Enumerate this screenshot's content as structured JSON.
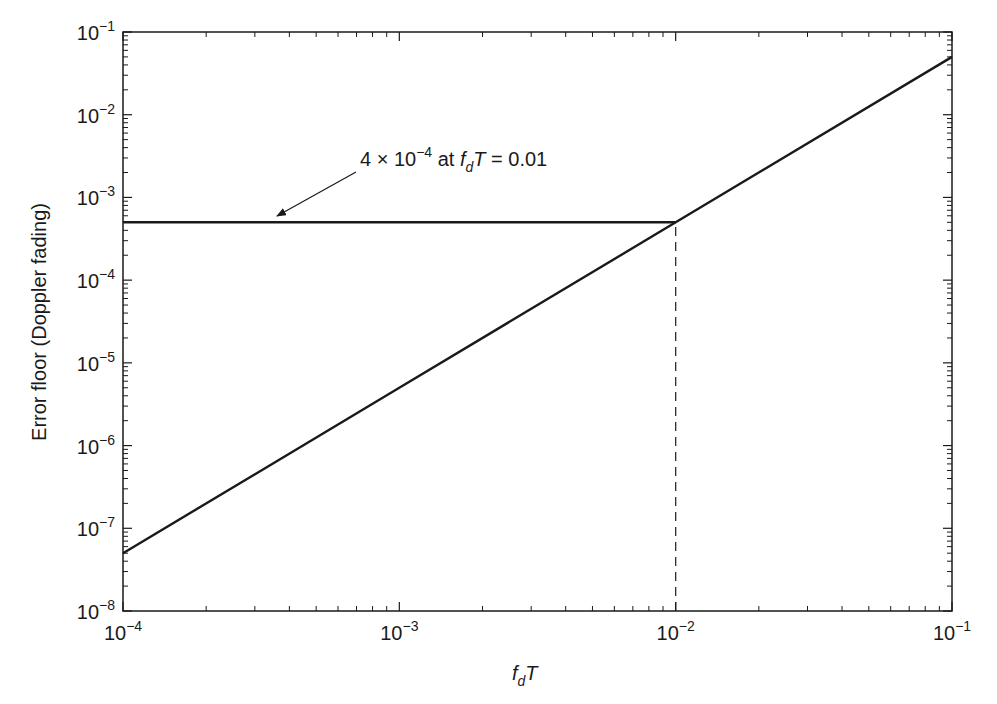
{
  "chart_data": {
    "type": "line",
    "title": "",
    "xlabel": "f_dT",
    "xlabel_parts": {
      "main": "f",
      "sub": "d",
      "tail": "T"
    },
    "ylabel": "Error floor (Doppler fading)",
    "xscale": "log",
    "yscale": "log",
    "xlim": [
      0.0001,
      0.1
    ],
    "ylim": [
      1e-08,
      0.1
    ],
    "grid": false,
    "x_ticks": [
      {
        "base": "10",
        "exp": "−4",
        "value": 0.0001
      },
      {
        "base": "10",
        "exp": "−3",
        "value": 0.001
      },
      {
        "base": "10",
        "exp": "−2",
        "value": 0.01
      },
      {
        "base": "10",
        "exp": "−1",
        "value": 0.1
      }
    ],
    "y_ticks": [
      {
        "base": "10",
        "exp": "−8",
        "value": 1e-08
      },
      {
        "base": "10",
        "exp": "−7",
        "value": 1e-07
      },
      {
        "base": "10",
        "exp": "−6",
        "value": 1e-06
      },
      {
        "base": "10",
        "exp": "−5",
        "value": 1e-05
      },
      {
        "base": "10",
        "exp": "−4",
        "value": 0.0001
      },
      {
        "base": "10",
        "exp": "−3",
        "value": 0.001
      },
      {
        "base": "10",
        "exp": "−2",
        "value": 0.01
      },
      {
        "base": "10",
        "exp": "−1",
        "value": 0.1
      }
    ],
    "series": [
      {
        "name": "Error floor vs f_dT",
        "style": "solid",
        "x": [
          0.0001,
          0.001,
          0.01,
          0.1
        ],
        "y": [
          5e-08,
          5e-06,
          0.0005,
          0.05
        ]
      },
      {
        "name": "Floor at f_dT = 0.01",
        "style": "solid",
        "x": [
          0.0001,
          0.01
        ],
        "y": [
          0.0005,
          0.0005
        ]
      },
      {
        "name": "Reference line at f_dT = 0.01",
        "style": "dashed",
        "x": [
          0.01,
          0.01
        ],
        "y": [
          1e-08,
          0.0005
        ]
      }
    ],
    "annotations": [
      {
        "text": "4 × 10^−4 at f_dT = 0.01",
        "parts": {
          "lead": "4 × 10",
          "exp": "−4",
          "mid": " at ",
          "f": "f",
          "sub": "d",
          "T": "T",
          "tail": " = 0.01"
        },
        "arrow_to": {
          "x": 0.00035,
          "y": 0.0005
        }
      }
    ],
    "legend": null
  }
}
